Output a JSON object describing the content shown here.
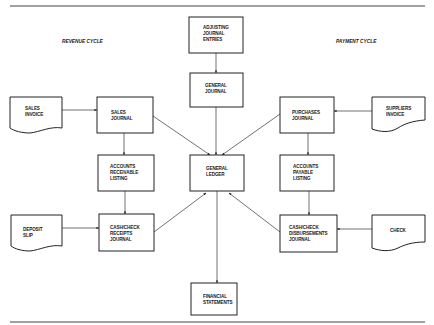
{
  "diagram": {
    "sections": {
      "revenue_cycle": "REVENUE CYCLE",
      "payment_cycle": "PAYMENT CYCLE"
    },
    "nodes": {
      "adjusting": [
        "ADJUSTING",
        "JOURNAL",
        "ENTRIES"
      ],
      "general_journal": [
        "GENERAL",
        "JOURNAL"
      ],
      "general_ledger": [
        "GENERAL",
        "LEDGER"
      ],
      "financial_statements": [
        "FINANCIAL",
        "STATEMENTS"
      ],
      "sales_invoice": [
        "SALES",
        "INVOICE"
      ],
      "sales_journal": [
        "SALES",
        "JOURNAL"
      ],
      "accounts_receivable": [
        "ACCOUNTS",
        "RECEIVABLE",
        "LISTING"
      ],
      "deposit_slip": [
        "DEPOSIT",
        "SLIP"
      ],
      "cash_receipts": [
        "CASH/CHECK",
        "RECEIPTS",
        "JOURNAL"
      ],
      "purchases_journal": [
        "PURCHASES",
        "JOURNAL"
      ],
      "suppliers_invoice": [
        "SUPPLIERS",
        "INVOICE"
      ],
      "accounts_payable": [
        "ACCOUNTS",
        "PAYABLE",
        "LISTING"
      ],
      "check": [
        "CHECK"
      ],
      "cash_disbursements": [
        "CASH/CHECK",
        "DISBURSEMENTS",
        "JOURNAL"
      ]
    },
    "edges": [
      {
        "from": "ADJUSTING JOURNAL ENTRIES",
        "to": "GENERAL JOURNAL"
      },
      {
        "from": "GENERAL JOURNAL",
        "to": "GENERAL LEDGER"
      },
      {
        "from": "SALES INVOICE",
        "to": "SALES JOURNAL"
      },
      {
        "from": "SALES JOURNAL",
        "to": "ACCOUNTS RECEIVABLE LISTING"
      },
      {
        "from": "SALES JOURNAL",
        "to": "GENERAL LEDGER"
      },
      {
        "from": "ACCOUNTS RECEIVABLE LISTING",
        "to": "CASH/CHECK RECEIPTS JOURNAL"
      },
      {
        "from": "DEPOSIT SLIP",
        "to": "CASH/CHECK RECEIPTS JOURNAL"
      },
      {
        "from": "CASH/CHECK RECEIPTS JOURNAL",
        "to": "GENERAL LEDGER"
      },
      {
        "from": "SUPPLIERS INVOICE",
        "to": "PURCHASES JOURNAL"
      },
      {
        "from": "PURCHASES JOURNAL",
        "to": "ACCOUNTS PAYABLE LISTING"
      },
      {
        "from": "PURCHASES JOURNAL",
        "to": "GENERAL LEDGER"
      },
      {
        "from": "ACCOUNTS PAYABLE LISTING",
        "to": "CASH/CHECK DISBURSEMENTS JOURNAL"
      },
      {
        "from": "CHECK",
        "to": "CASH/CHECK DISBURSEMENTS JOURNAL"
      },
      {
        "from": "CASH/CHECK DISBURSEMENTS JOURNAL",
        "to": "GENERAL LEDGER"
      },
      {
        "from": "GENERAL LEDGER",
        "to": "FINANCIAL STATEMENTS"
      }
    ]
  }
}
